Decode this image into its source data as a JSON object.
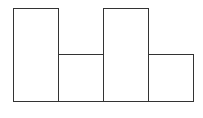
{
  "chart_data": {
    "type": "bar",
    "title": "",
    "xlabel": "",
    "ylabel": "",
    "categories": [
      "1",
      "2",
      "3",
      "4"
    ],
    "values": [
      2,
      1,
      2,
      1
    ],
    "ylim": [
      0,
      2
    ],
    "grid": false,
    "legend": null,
    "style": {
      "fill": "#ffffff",
      "edge": "#333333"
    }
  },
  "layout": {
    "plot_left": 13,
    "plot_bottom": 101,
    "bar_width": 45,
    "max_height": 93
  }
}
